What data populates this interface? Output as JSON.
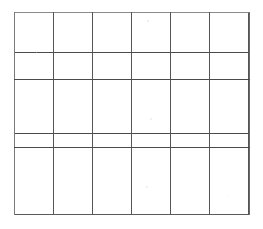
{
  "document": {
    "title": "Blank Grid Table",
    "description": "Empty hand-drawn style table with 6 columns and 3 rows",
    "background_color": "#ffffff",
    "line_color": "#4a4a4a",
    "border_color": "#6e6e6e"
  },
  "grid": {
    "columns": 6,
    "rows": 3,
    "column_width_px": 39,
    "row_height_px": 67,
    "left_px": 14,
    "top_px": 12,
    "right_px": 249,
    "bottom_px": 215,
    "horizontal_rule_y": [
      79,
      147
    ],
    "vertical_rule_x": [
      53,
      92,
      131,
      170,
      209
    ],
    "cells": [
      [
        "",
        "",
        "",
        "",
        "",
        ""
      ],
      [
        "",
        "",
        "",
        "",
        "",
        ""
      ],
      [
        "",
        "",
        "",
        "",
        "",
        ""
      ]
    ]
  },
  "artifacts": {
    "speckles": [
      {
        "x": 147,
        "y": 20,
        "size": 2
      },
      {
        "x": 150,
        "y": 118,
        "size": 2
      },
      {
        "x": 146,
        "y": 186,
        "size": 2
      },
      {
        "x": 36,
        "y": 52,
        "size": 1
      },
      {
        "x": 228,
        "y": 196,
        "size": 1
      }
    ]
  }
}
